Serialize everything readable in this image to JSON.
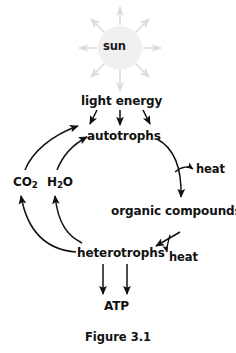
{
  "figure": {
    "caption": "Figure 3.1",
    "type": "energy-flow-cycle-diagram",
    "background_color": "#ffffff",
    "stroke_color": "#111111",
    "sun_fill_color": "#f0f0f0",
    "sun_ray_color": "#e2e2e2"
  },
  "nodes": {
    "sun": {
      "label": "sun"
    },
    "light_energy": {
      "label": "light energy"
    },
    "autotrophs": {
      "label": "autotrophs"
    },
    "co2": {
      "label": "CO",
      "sub": "2"
    },
    "h2o": {
      "label": "H",
      "sub": "2",
      "tail": "O"
    },
    "heat_autotrophs": {
      "label": "heat"
    },
    "organic_compounds": {
      "label": "organic compounds"
    },
    "heterotrophs": {
      "label": "heterotrophs"
    },
    "heat_heterotrophs": {
      "label": "heat"
    },
    "atp": {
      "label": "ATP"
    }
  },
  "edges": [
    {
      "name": "sun-rays",
      "from": "sun",
      "to": "surroundings",
      "style": "eight-radial-light-gray-arrows"
    },
    {
      "name": "sun-to-light-energy",
      "from": "sun",
      "to": "light_energy",
      "style": "straight-down-light-gray"
    },
    {
      "name": "light-energy-to-autotrophs-left",
      "from": "light_energy",
      "to": "autotrophs",
      "style": "straight-diagonal"
    },
    {
      "name": "light-energy-to-autotrophs-center",
      "from": "light_energy",
      "to": "autotrophs",
      "style": "straight-down"
    },
    {
      "name": "light-energy-to-autotrophs-right",
      "from": "light_energy",
      "to": "autotrophs",
      "style": "straight-diagonal"
    },
    {
      "name": "co2-to-autotrophs",
      "from": "co2",
      "to": "autotrophs",
      "style": "curved-up-right"
    },
    {
      "name": "h2o-to-autotrophs",
      "from": "h2o",
      "to": "autotrophs",
      "style": "curved-up-right"
    },
    {
      "name": "autotrophs-to-organic-compounds",
      "from": "autotrophs",
      "to": "organic_compounds",
      "style": "curved-down-right"
    },
    {
      "name": "autotrophs-branch-to-heat",
      "from": "autotrophs",
      "to": "heat_autotrophs",
      "style": "short-curve-right"
    },
    {
      "name": "organic-compounds-to-heterotrophs",
      "from": "organic_compounds",
      "to": "heterotrophs",
      "style": "straight-diagonal-down-left"
    },
    {
      "name": "heterotrophs-branch-to-heat",
      "from": "heterotrophs",
      "to": "heat_heterotrophs",
      "style": "short-curve-down"
    },
    {
      "name": "heterotrophs-to-co2",
      "from": "heterotrophs",
      "to": "co2",
      "style": "curved-up-left"
    },
    {
      "name": "heterotrophs-to-h2o",
      "from": "heterotrophs",
      "to": "h2o",
      "style": "curved-up-left"
    },
    {
      "name": "heterotrophs-to-atp-left",
      "from": "heterotrophs",
      "to": "atp",
      "style": "straight-down"
    },
    {
      "name": "heterotrophs-to-atp-right",
      "from": "heterotrophs",
      "to": "atp",
      "style": "straight-down"
    }
  ]
}
